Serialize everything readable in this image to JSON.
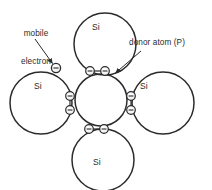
{
  "diagram": {
    "type": "semiconductor-doping-schematic",
    "stroke_color": "#2b2b2b",
    "background_color": "#ffffff",
    "callouts": [
      {
        "id": "mobile-electron",
        "line1": "mobile",
        "line2": "electron",
        "full_text": "mobile electron"
      },
      {
        "id": "donor-atom",
        "text": "donor atom (P)"
      }
    ],
    "atoms": [
      {
        "id": "si-top",
        "label": "Si",
        "position": "top"
      },
      {
        "id": "si-left",
        "label": "Si",
        "position": "left"
      },
      {
        "id": "si-right",
        "label": "Si",
        "position": "right"
      },
      {
        "id": "si-bottom",
        "label": "Si",
        "position": "bottom"
      },
      {
        "id": "donor-center",
        "label": "",
        "position": "center"
      }
    ],
    "electrons": {
      "symbol": "-",
      "free_count": 1,
      "bond_pairs": 4,
      "electrons_per_bond": 2
    }
  }
}
